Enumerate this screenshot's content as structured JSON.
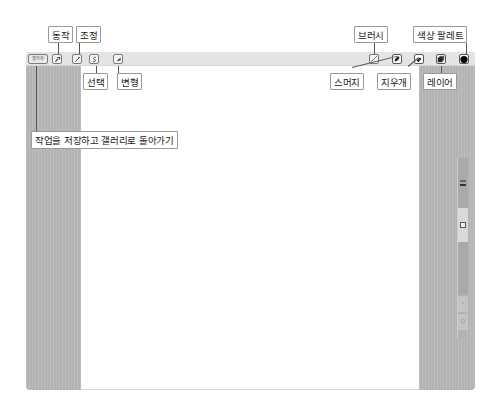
{
  "toolbar": {
    "gallery_label": "갤러리",
    "left_tools": [
      {
        "name": "actions",
        "icon": "wrench-icon",
        "glyph": "🔧"
      },
      {
        "name": "adjustments",
        "icon": "magic-wand-icon",
        "glyph": "⁄"
      },
      {
        "name": "selection",
        "icon": "selection-s-icon",
        "glyph": "S"
      },
      {
        "name": "transform",
        "icon": "cursor-arrow-icon",
        "glyph": "➚"
      }
    ],
    "right_tools": [
      {
        "name": "brush",
        "icon": "brush-icon"
      },
      {
        "name": "smudge",
        "icon": "smudge-icon"
      },
      {
        "name": "eraser",
        "icon": "eraser-icon"
      },
      {
        "name": "layers",
        "icon": "layers-icon"
      },
      {
        "name": "color-palette",
        "icon": "color-circle-icon",
        "color": "#000000"
      }
    ]
  },
  "callouts": {
    "actions": "동작",
    "adjustments": "조정",
    "selection": "선택",
    "transform": "변형",
    "brush": "브러시",
    "color_palette": "색상 팔레트",
    "smudge": "스머지",
    "eraser": "지우개",
    "layers": "레이어",
    "gallery": "작업을 저장하고 갤러리로 돌아가기"
  },
  "sidebar": {
    "brush_size_label": "",
    "opacity_label": "",
    "undo_icon": "undo-icon",
    "redo_icon": "redo-icon"
  },
  "colors": {
    "panel_gray": "#b9b9b9",
    "toolbar_bg": "#e4e4e4",
    "current_color": "#000000"
  }
}
